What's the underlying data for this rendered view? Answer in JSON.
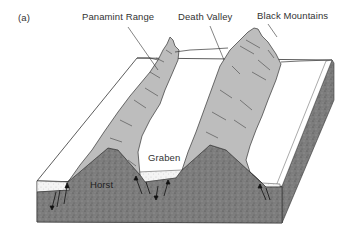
{
  "figure": {
    "panel_label": "(a)",
    "labels": {
      "panamint_range": "Panamint Range",
      "death_valley": "Death Valley",
      "black_mountains": "Black Mountains",
      "graben": "Graben",
      "horst": "Horst"
    },
    "colors": {
      "mountain_fill": "#bdbdbd",
      "valley_fill": "#ffffff",
      "rock_fill": "#7a7a7a",
      "sediment_fill": "#f2f2f2",
      "outline": "#333333"
    }
  }
}
